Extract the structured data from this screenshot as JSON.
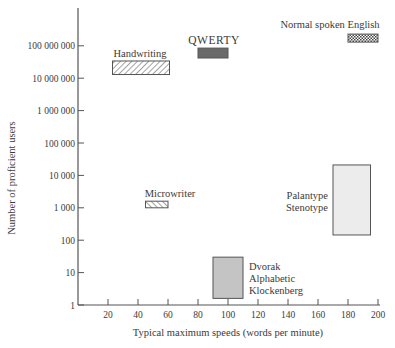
{
  "chart_data": {
    "type": "range-box",
    "title": "",
    "xlabel": "Typical maximum speeds (words per minute)",
    "ylabel": "Number of proficient users",
    "xscale": "linear",
    "yscale": "log",
    "xlim": [
      0,
      200
    ],
    "ylim": [
      1,
      1000000000
    ],
    "xticks": [
      20,
      40,
      60,
      80,
      100,
      120,
      140,
      160,
      180,
      200
    ],
    "xtick_labels": [
      "20",
      "40",
      "60",
      "80",
      "100",
      "120",
      "140",
      "160",
      "180",
      "200"
    ],
    "yticks": [
      1,
      10,
      100,
      1000,
      10000,
      100000,
      1000000,
      10000000,
      100000000
    ],
    "ytick_labels": [
      "1",
      "10",
      "100",
      "1 000",
      "10 000",
      "100 000",
      "1 000 000",
      "10 000 000",
      "100 000 000"
    ],
    "grid": false,
    "legend": "none (direct labels)",
    "series": [
      {
        "name": "Handwriting",
        "label_lines": [
          "Handwriting"
        ],
        "x_range": [
          23,
          61
        ],
        "y_range": [
          13000000,
          34000000
        ],
        "fill": "diagonal-hatch-right"
      },
      {
        "name": "QWERTY",
        "label_lines": [
          "QWERTY"
        ],
        "x_range": [
          80,
          100
        ],
        "y_range": [
          42000000,
          85000000
        ],
        "fill": "dark-solid"
      },
      {
        "name": "Normal spoken English",
        "label_lines": [
          "Normal spoken English"
        ],
        "x_range": [
          180,
          200
        ],
        "y_range": [
          130000000,
          230000000
        ],
        "fill": "cross-hatch"
      },
      {
        "name": "Microwriter",
        "label_lines": [
          "Microwriter"
        ],
        "x_range": [
          45,
          60
        ],
        "y_range": [
          1000,
          1600
        ],
        "fill": "diagonal-hatch-left"
      },
      {
        "name": "Palantype / Stenotype",
        "label_lines": [
          "Palantype",
          "Stenotype"
        ],
        "x_range": [
          170,
          195
        ],
        "y_range": [
          145,
          21000
        ],
        "fill": "light-gray"
      },
      {
        "name": "Dvorak / Alphabetic / Klockenberg",
        "label_lines": [
          "Dvorak",
          "Alphabetic",
          "Klockenberg"
        ],
        "x_range": [
          90,
          110
        ],
        "y_range": [
          1.6,
          30
        ],
        "fill": "medium-gray"
      }
    ]
  },
  "colors": {
    "axis": "#555555",
    "text": "#3a3a3a",
    "qwerty_fill": "#6a6a6a",
    "palantype_fill": "#ececec",
    "dvorak_fill": "#c4c4c4",
    "hatch": "#555555"
  }
}
